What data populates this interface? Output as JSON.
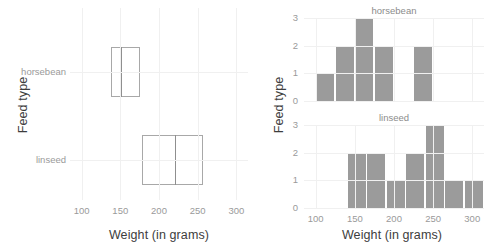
{
  "figure": {
    "left_panel": {
      "name": "boxplot-panel",
      "xlabel": "Weight (in grams)",
      "ylabel": "Feed type",
      "x_ticks": [
        "100",
        "150",
        "200",
        "250",
        "300"
      ],
      "x_tick_values": [
        100,
        150,
        200,
        250,
        300
      ],
      "categories": [
        "horsebean",
        "linseed"
      ]
    },
    "right_panel": {
      "name": "histogram-panel",
      "xlabel": "Weight (in grams)",
      "ylabel": "Feed type",
      "x_ticks": [
        "100",
        "150",
        "200",
        "250",
        "300"
      ],
      "x_tick_values": [
        100,
        150,
        200,
        250,
        300
      ],
      "y_ticks": [
        "0",
        "1",
        "2",
        "3"
      ],
      "y_tick_values": [
        0,
        1,
        2,
        3
      ],
      "facets": [
        "horsebean",
        "linseed"
      ]
    }
  },
  "chart_data": [
    {
      "type": "box",
      "name": "boxplot-horsebean-linseed",
      "title": "",
      "xlabel": "Weight (in grams)",
      "ylabel": "Feed type",
      "xlim": [
        85,
        315
      ],
      "orientation": "horizontal",
      "categories": [
        "horsebean",
        "linseed"
      ],
      "boxes": [
        {
          "category": "horsebean",
          "whisker_low": 108,
          "q1": 138,
          "median": 151,
          "q3": 176,
          "whisker_high": 227
        },
        {
          "category": "linseed",
          "whisker_low": 141,
          "q1": 178,
          "median": 221,
          "q3": 257,
          "whisker_high": 309
        }
      ]
    },
    {
      "type": "bar",
      "name": "histogram-horsebean",
      "title": "horsebean",
      "xlabel": "Weight (in grams)",
      "ylabel": "Feed type",
      "xlim": [
        85,
        315
      ],
      "ylim": [
        0,
        3
      ],
      "binwidth": 25,
      "bins": [
        {
          "start": 100,
          "end": 125,
          "count": 1
        },
        {
          "start": 125,
          "end": 150,
          "count": 2
        },
        {
          "start": 150,
          "end": 175,
          "count": 3
        },
        {
          "start": 175,
          "end": 200,
          "count": 2
        },
        {
          "start": 200,
          "end": 225,
          "count": 0
        },
        {
          "start": 225,
          "end": 250,
          "count": 2
        }
      ]
    },
    {
      "type": "bar",
      "name": "histogram-linseed",
      "title": "linseed",
      "xlabel": "Weight (in grams)",
      "ylabel": "Feed type",
      "xlim": [
        85,
        315
      ],
      "ylim": [
        0,
        3
      ],
      "binwidth": 25,
      "bins": [
        {
          "start": 140,
          "end": 165,
          "count": 2
        },
        {
          "start": 165,
          "end": 190,
          "count": 2
        },
        {
          "start": 190,
          "end": 215,
          "count": 1
        },
        {
          "start": 215,
          "end": 240,
          "count": 2
        },
        {
          "start": 240,
          "end": 265,
          "count": 3
        },
        {
          "start": 265,
          "end": 290,
          "count": 1
        },
        {
          "start": 290,
          "end": 315,
          "count": 1
        }
      ]
    }
  ],
  "colors": {
    "bar_fill": "#9b9b9b",
    "box_stroke": "#a8a8a8",
    "gridline": "#f0f0f0",
    "tick_text": "#9a9a9a",
    "axis_title": "#3d3d3d",
    "background": "#ffffff"
  }
}
